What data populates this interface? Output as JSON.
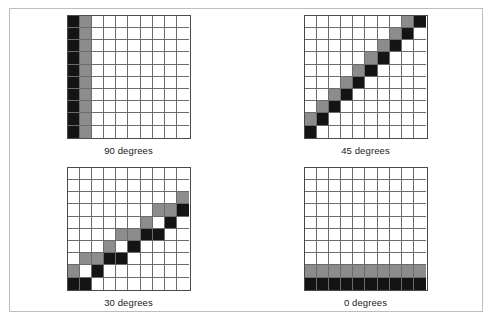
{
  "figure": {
    "background_color": "#ffffff",
    "frame_color": "#bdbdbd",
    "grid_line_color": "#6b6b6b",
    "grid_border_color": "#4a4a4a",
    "grid_rows": 10,
    "grid_columns": 10
  },
  "palette": {
    "white": "#ffffff",
    "gray": "#8c8c8c",
    "black": "#141414"
  },
  "chart_data": {
    "type": "heatmap",
    "title": "",
    "xlabel": "",
    "ylabel": "",
    "legend": [],
    "grid": true,
    "cell_values": {
      "0": "white",
      "1": "gray",
      "2": "black"
    },
    "panels": [
      {
        "label": "90 degrees",
        "angle_degrees": 90,
        "rows": 10,
        "columns": 10,
        "matrix": [
          [
            2,
            1,
            0,
            0,
            0,
            0,
            0,
            0,
            0,
            0
          ],
          [
            2,
            1,
            0,
            0,
            0,
            0,
            0,
            0,
            0,
            0
          ],
          [
            2,
            1,
            0,
            0,
            0,
            0,
            0,
            0,
            0,
            0
          ],
          [
            2,
            1,
            0,
            0,
            0,
            0,
            0,
            0,
            0,
            0
          ],
          [
            2,
            1,
            0,
            0,
            0,
            0,
            0,
            0,
            0,
            0
          ],
          [
            2,
            1,
            0,
            0,
            0,
            0,
            0,
            0,
            0,
            0
          ],
          [
            2,
            1,
            0,
            0,
            0,
            0,
            0,
            0,
            0,
            0
          ],
          [
            2,
            1,
            0,
            0,
            0,
            0,
            0,
            0,
            0,
            0
          ],
          [
            2,
            1,
            0,
            0,
            0,
            0,
            0,
            0,
            0,
            0
          ],
          [
            2,
            1,
            0,
            0,
            0,
            0,
            0,
            0,
            0,
            0
          ]
        ]
      },
      {
        "label": "45 degrees",
        "angle_degrees": 45,
        "rows": 10,
        "columns": 10,
        "matrix": [
          [
            0,
            0,
            0,
            0,
            0,
            0,
            0,
            0,
            1,
            2
          ],
          [
            0,
            0,
            0,
            0,
            0,
            0,
            0,
            1,
            2,
            0
          ],
          [
            0,
            0,
            0,
            0,
            0,
            0,
            1,
            2,
            0,
            0
          ],
          [
            0,
            0,
            0,
            0,
            0,
            1,
            2,
            0,
            0,
            0
          ],
          [
            0,
            0,
            0,
            0,
            1,
            2,
            0,
            0,
            0,
            0
          ],
          [
            0,
            0,
            0,
            1,
            2,
            0,
            0,
            0,
            0,
            0
          ],
          [
            0,
            0,
            1,
            2,
            0,
            0,
            0,
            0,
            0,
            0
          ],
          [
            0,
            1,
            2,
            0,
            0,
            0,
            0,
            0,
            0,
            0
          ],
          [
            1,
            2,
            0,
            0,
            0,
            0,
            0,
            0,
            0,
            0
          ],
          [
            2,
            0,
            0,
            0,
            0,
            0,
            0,
            0,
            0,
            0
          ]
        ]
      },
      {
        "label": "30 degrees",
        "angle_degrees": 30,
        "rows": 10,
        "columns": 10,
        "matrix": [
          [
            0,
            0,
            0,
            0,
            0,
            0,
            0,
            0,
            0,
            0
          ],
          [
            0,
            0,
            0,
            0,
            0,
            0,
            0,
            0,
            0,
            0
          ],
          [
            0,
            0,
            0,
            0,
            0,
            0,
            0,
            0,
            0,
            1
          ],
          [
            0,
            0,
            0,
            0,
            0,
            0,
            0,
            1,
            1,
            2
          ],
          [
            0,
            0,
            0,
            0,
            0,
            0,
            1,
            0,
            2,
            0
          ],
          [
            0,
            0,
            0,
            0,
            1,
            1,
            2,
            2,
            0,
            0
          ],
          [
            0,
            0,
            0,
            1,
            0,
            2,
            0,
            0,
            0,
            0
          ],
          [
            0,
            1,
            1,
            2,
            2,
            0,
            0,
            0,
            0,
            0
          ],
          [
            1,
            0,
            2,
            0,
            0,
            0,
            0,
            0,
            0,
            0
          ],
          [
            2,
            2,
            0,
            0,
            0,
            0,
            0,
            0,
            0,
            0
          ]
        ]
      },
      {
        "label": "0 degrees",
        "angle_degrees": 0,
        "rows": 10,
        "columns": 10,
        "matrix": [
          [
            0,
            0,
            0,
            0,
            0,
            0,
            0,
            0,
            0,
            0
          ],
          [
            0,
            0,
            0,
            0,
            0,
            0,
            0,
            0,
            0,
            0
          ],
          [
            0,
            0,
            0,
            0,
            0,
            0,
            0,
            0,
            0,
            0
          ],
          [
            0,
            0,
            0,
            0,
            0,
            0,
            0,
            0,
            0,
            0
          ],
          [
            0,
            0,
            0,
            0,
            0,
            0,
            0,
            0,
            0,
            0
          ],
          [
            0,
            0,
            0,
            0,
            0,
            0,
            0,
            0,
            0,
            0
          ],
          [
            0,
            0,
            0,
            0,
            0,
            0,
            0,
            0,
            0,
            0
          ],
          [
            0,
            0,
            0,
            0,
            0,
            0,
            0,
            0,
            0,
            0
          ],
          [
            1,
            1,
            1,
            1,
            1,
            1,
            1,
            1,
            1,
            1
          ],
          [
            2,
            2,
            2,
            2,
            2,
            2,
            2,
            2,
            2,
            2
          ]
        ]
      }
    ]
  }
}
